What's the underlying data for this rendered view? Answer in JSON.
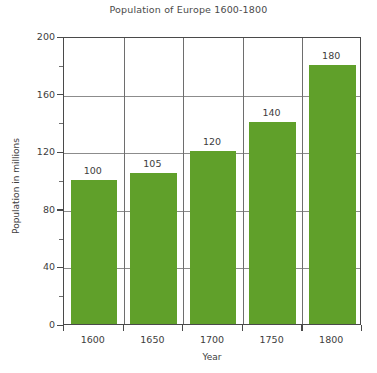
{
  "chart_data": {
    "type": "bar",
    "title": "Population of Europe 1600-1800",
    "xlabel": "Year",
    "ylabel": "Population in millions",
    "categories": [
      "1600",
      "1650",
      "1700",
      "1750",
      "1800"
    ],
    "values": [
      100,
      105,
      120,
      140,
      180
    ],
    "data_labels": [
      "100",
      "105",
      "120",
      "140",
      "180"
    ],
    "ylim": [
      0,
      200
    ],
    "y_major_ticks": [
      0,
      40,
      80,
      120,
      160,
      200
    ],
    "y_major_tick_labels": [
      "0",
      "40",
      "80",
      "120",
      "160",
      "200"
    ],
    "y_minor_ticks": [
      20,
      60,
      100,
      140,
      180
    ],
    "grid": {
      "horizontal": true,
      "vertical": true
    },
    "legend": null,
    "series": [
      {
        "name": "Population of Europe",
        "values": [
          100,
          105,
          120,
          140,
          180
        ],
        "color": "#60a02a"
      }
    ],
    "colors": {
      "bar": "#60a02a",
      "axis": "#4a4a4a",
      "grid": "#8c8c8c",
      "text": "#3d3d3d",
      "background": "#ffffff"
    }
  }
}
